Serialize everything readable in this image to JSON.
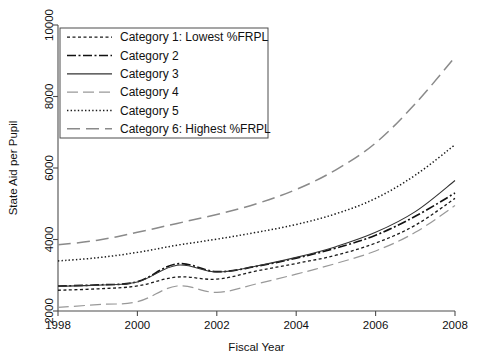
{
  "chart_data": {
    "type": "line",
    "title": "",
    "xlabel": "Fiscal Year",
    "ylabel": "State Aid per Pupil",
    "xlim": [
      1998,
      2008
    ],
    "ylim": [
      2000,
      10000
    ],
    "xticks": [
      1998,
      2000,
      2002,
      2004,
      2006,
      2008
    ],
    "xtick_labels": [
      "1998",
      "2000",
      "2002",
      "2004",
      "2006",
      "2008"
    ],
    "yticks": [
      2000,
      4000,
      6000,
      8000,
      10000
    ],
    "ytick_labels": [
      "2000",
      "4000",
      "6000",
      "8000",
      "10000"
    ],
    "grid": false,
    "legend_position": "upper left",
    "x": [
      1998,
      1999,
      2000,
      2001,
      2002,
      2003,
      2004,
      2005,
      2006,
      2007,
      2008
    ],
    "series": [
      {
        "name": "Category 1: Lowest %FRPL",
        "dash": "3,2.5",
        "width": 1.3,
        "color": "#1a1a1a",
        "values": [
          2580,
          2620,
          2700,
          2950,
          2890,
          3120,
          3330,
          3560,
          3900,
          4400,
          5150
        ]
      },
      {
        "name": "Category 2",
        "dash": "9,2.5,2,2.5",
        "width": 1.7,
        "color": "#111111",
        "values": [
          2700,
          2730,
          2820,
          3320,
          3100,
          3250,
          3480,
          3760,
          4120,
          4650,
          5300
        ]
      },
      {
        "name": "Category 3",
        "dash": "none",
        "width": 1.1,
        "color": "#333333",
        "values": [
          2690,
          2725,
          2810,
          3280,
          3090,
          3260,
          3500,
          3800,
          4200,
          4780,
          5650
        ]
      },
      {
        "name": "Category 4",
        "dash": "11,5",
        "width": 1.2,
        "color": "#999999",
        "values": [
          2100,
          2180,
          2260,
          2700,
          2520,
          2760,
          3030,
          3330,
          3680,
          4200,
          4950
        ]
      },
      {
        "name": "Category 5",
        "dash": "1.4,2.2",
        "width": 1.5,
        "color": "#1a1a1a",
        "values": [
          3400,
          3490,
          3640,
          3840,
          4010,
          4200,
          4420,
          4720,
          5150,
          5800,
          6650
        ]
      },
      {
        "name": "Category 6: Highest %FRPL",
        "dash": "13,6",
        "width": 1.5,
        "color": "#8a8a8a",
        "values": [
          3850,
          3980,
          4200,
          4450,
          4700,
          5000,
          5400,
          5950,
          6700,
          7800,
          9100
        ]
      }
    ]
  },
  "legend": {
    "items": [
      {
        "label": "Category 1: Lowest %FRPL"
      },
      {
        "label": "Category 2"
      },
      {
        "label": "Category 3"
      },
      {
        "label": "Category 4"
      },
      {
        "label": "Category 5"
      },
      {
        "label": "Category 6: Highest %FRPL"
      }
    ]
  },
  "axes": {
    "x_title": "Fiscal Year",
    "y_title": "State Aid per Pupil"
  }
}
